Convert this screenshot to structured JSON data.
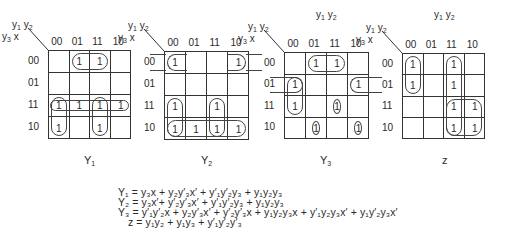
{
  "header": {
    "row_var": "y3x",
    "col_var": "y1y2"
  },
  "col_labels": [
    "00",
    "01",
    "11",
    "10"
  ],
  "row_labels": [
    "00",
    "01",
    "11",
    "10"
  ],
  "maps": [
    {
      "name": "Y1",
      "caption": "Y",
      "caption_sub": "1",
      "cells": [
        [
          "",
          "1",
          "1",
          ""
        ],
        [
          "",
          "",
          "",
          ""
        ],
        [
          "1",
          "1",
          "1",
          "1"
        ],
        [
          "1",
          "",
          "1",
          ""
        ]
      ]
    },
    {
      "name": "Y2",
      "caption": "Y",
      "caption_sub": "2",
      "cells": [
        [
          "1",
          "",
          "",
          "1"
        ],
        [
          "",
          "",
          "",
          ""
        ],
        [
          "1",
          "",
          "1",
          ""
        ],
        [
          "1",
          "1",
          "1",
          "1"
        ]
      ]
    },
    {
      "name": "Y3",
      "caption": "Y",
      "caption_sub": "3",
      "cells": [
        [
          "",
          "1",
          "1",
          ""
        ],
        [
          "1",
          "",
          "",
          "1"
        ],
        [
          "1",
          "",
          "1",
          ""
        ],
        [
          "",
          "1",
          "",
          "1"
        ]
      ]
    },
    {
      "name": "z",
      "caption": "z",
      "caption_sub": "",
      "cells": [
        [
          "1",
          "",
          "1",
          ""
        ],
        [
          "1",
          "",
          "1",
          ""
        ],
        [
          "",
          "",
          "1",
          "1"
        ],
        [
          "",
          "",
          "1",
          "1"
        ]
      ]
    }
  ],
  "equations": [
    "Y₁ = y₃x + y₂y′₃x′ + y′₁y′₂y₃ + y₁y₂y₃",
    "Y₂ = y₃x′+ y′₂y′₃x′ + y′₁y′₂y₃ + y₁y₂y₃",
    "Y₃ = y′₁y′₂x + y₂y′₃x′ + y′₂y′₃x + y₁y₂y₃x + y′₁y₂y₃x′ + y₁y′₂y₃x′",
    "z = y₁y₂ + y₁y₃ + y′₁y′₂y′₃"
  ]
}
